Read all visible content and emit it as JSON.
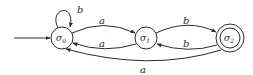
{
  "diagram": {
    "type": "finite-automaton",
    "colors": {
      "stroke": "#2a2a2a",
      "background": "#ffffff"
    },
    "states": [
      {
        "id": "s0",
        "symbol": "σ",
        "subscript": "0",
        "initial": true,
        "accepting": false
      },
      {
        "id": "s1",
        "symbol": "σ",
        "subscript": "1",
        "initial": false,
        "accepting": false
      },
      {
        "id": "s2",
        "symbol": "σ",
        "subscript": "2",
        "initial": false,
        "accepting": true
      }
    ],
    "transitions": [
      {
        "from": "s0",
        "to": "s0",
        "label": "b"
      },
      {
        "from": "s0",
        "to": "s1",
        "label": "a"
      },
      {
        "from": "s1",
        "to": "s0",
        "label": "a"
      },
      {
        "from": "s1",
        "to": "s2",
        "label": "b"
      },
      {
        "from": "s2",
        "to": "s1",
        "label": "b"
      },
      {
        "from": "s2",
        "to": "s0",
        "label": "a"
      }
    ]
  }
}
